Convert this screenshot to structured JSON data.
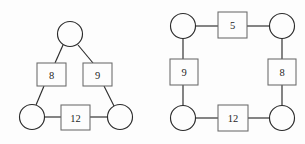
{
  "figures": [
    {
      "id": "left-triangle-graph",
      "name": "triangle-graph",
      "shape": "triangle",
      "vertices": [
        {
          "id": "v-top",
          "label": "",
          "cx": 70,
          "cy": 34,
          "r": 12.5
        },
        {
          "id": "v-bottom-left",
          "label": "",
          "cx": 32,
          "cy": 117,
          "r": 12.5
        },
        {
          "id": "v-bottom-right",
          "label": "",
          "cx": 120,
          "cy": 117,
          "r": 12.5
        }
      ],
      "edge_boxes": [
        {
          "id": "box-8",
          "label": "8",
          "x": 37,
          "y": 63,
          "w": 29,
          "h": 23
        },
        {
          "id": "box-9",
          "label": "9",
          "x": 83,
          "y": 63,
          "w": 29,
          "h": 23
        },
        {
          "id": "box-12",
          "label": "12",
          "x": 61,
          "y": 105,
          "w": 29,
          "h": 25
        }
      ],
      "edges": [
        {
          "id": "edge-top-to-8",
          "x1": 63,
          "y1": 45,
          "x2": 55,
          "y2": 63
        },
        {
          "id": "edge-8-to-bl",
          "x1": 44,
          "y1": 86,
          "x2": 36,
          "y2": 105
        },
        {
          "id": "edge-top-to-9",
          "x1": 78,
          "y1": 45,
          "x2": 93,
          "y2": 63
        },
        {
          "id": "edge-9-to-br",
          "x1": 104,
          "y1": 86,
          "x2": 114,
          "y2": 106
        },
        {
          "id": "edge-bl-to-12",
          "x1": 44,
          "y1": 117,
          "x2": 61,
          "y2": 117
        },
        {
          "id": "edge-12-to-br",
          "x1": 90,
          "y1": 117,
          "x2": 108,
          "y2": 117
        }
      ]
    },
    {
      "id": "right-square-graph",
      "name": "square-graph",
      "shape": "square",
      "vertices": [
        {
          "id": "v-top-left",
          "label": "",
          "cx": 183,
          "cy": 26,
          "r": 12.5
        },
        {
          "id": "v-top-right",
          "label": "",
          "cx": 282,
          "cy": 26,
          "r": 12.5
        },
        {
          "id": "v-bottom-left",
          "label": "",
          "cx": 183,
          "cy": 118,
          "r": 12.5
        },
        {
          "id": "v-bottom-right",
          "label": "",
          "cx": 282,
          "cy": 118,
          "r": 12.5
        }
      ],
      "edge_boxes": [
        {
          "id": "box-5",
          "label": "5",
          "x": 218,
          "y": 12,
          "w": 29,
          "h": 26
        },
        {
          "id": "box-9",
          "label": "9",
          "x": 170,
          "y": 59,
          "w": 28,
          "h": 26
        },
        {
          "id": "box-8",
          "label": "8",
          "x": 268,
          "y": 59,
          "w": 28,
          "h": 26
        },
        {
          "id": "box-12",
          "label": "12",
          "x": 218,
          "y": 105,
          "w": 30,
          "h": 26
        }
      ],
      "edges": [
        {
          "id": "edge-tl-to-5",
          "x1": 195.5,
          "y1": 26,
          "x2": 218,
          "y2": 26
        },
        {
          "id": "edge-5-to-tr",
          "x1": 247,
          "y1": 26,
          "x2": 269.5,
          "y2": 26
        },
        {
          "id": "edge-tl-to-9",
          "x1": 183,
          "y1": 38,
          "x2": 183,
          "y2": 59
        },
        {
          "id": "edge-9-to-bl",
          "x1": 183,
          "y1": 85,
          "x2": 183,
          "y2": 106
        },
        {
          "id": "edge-tr-to-8",
          "x1": 282,
          "y1": 38,
          "x2": 282,
          "y2": 59
        },
        {
          "id": "edge-8-to-br",
          "x1": 282,
          "y1": 85,
          "x2": 282,
          "y2": 106
        },
        {
          "id": "edge-bl-to-12",
          "x1": 195.5,
          "y1": 118,
          "x2": 218,
          "y2": 118
        },
        {
          "id": "edge-12-to-br",
          "x1": 248,
          "y1": 118,
          "x2": 269.5,
          "y2": 118
        }
      ]
    }
  ],
  "colors": {
    "background": "#fdfdfd",
    "edge_stroke": "#2b2b2b",
    "circle_stroke": "#2b2b2b",
    "box_stroke": "#6a6a6a",
    "label_text": "#1d1d1d"
  },
  "all_box_labels": [
    "8",
    "9",
    "12",
    "5",
    "9",
    "8",
    "12"
  ]
}
